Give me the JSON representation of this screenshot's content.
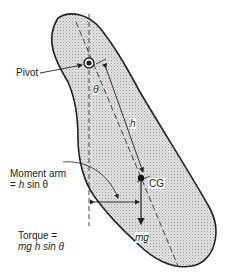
{
  "diagram": {
    "labels": {
      "pivot": "Pivot",
      "theta": "θ",
      "h": "h",
      "cg": "CG",
      "mg": "mg",
      "moment_arm_line1": "Moment arm",
      "moment_arm_eq": "=",
      "moment_arm_h": "h",
      "moment_arm_sin": "sin θ",
      "torque_line1": "Torque =",
      "torque_line2": "mg h sin θ"
    },
    "colors": {
      "outline": "#222222",
      "fill": "#d6d6d6",
      "text": "#222222"
    }
  }
}
